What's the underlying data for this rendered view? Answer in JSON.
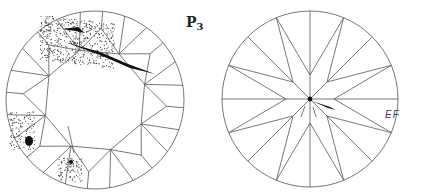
{
  "figure": {
    "label_main": "P",
    "label_sub": "3",
    "crown_view": {
      "name": "crown",
      "inclusions": [
        "feather-top",
        "crystal-left",
        "cloud-bottom"
      ]
    },
    "pavilion_view": {
      "name": "pavilion",
      "annotation": "EF"
    }
  },
  "colors": {
    "ink": "#333333",
    "background": "#ffffff"
  }
}
